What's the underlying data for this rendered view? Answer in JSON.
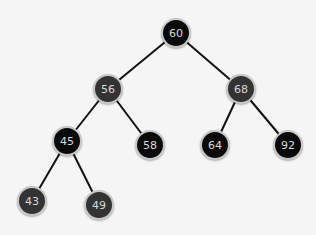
{
  "tree": {
    "nodes": [
      {
        "id": "n60",
        "value": "60",
        "x": 176,
        "y": 33,
        "color": "black"
      },
      {
        "id": "n56",
        "value": "56",
        "x": 108,
        "y": 89,
        "color": "gray"
      },
      {
        "id": "n68",
        "value": "68",
        "x": 241,
        "y": 89,
        "color": "gray"
      },
      {
        "id": "n45",
        "value": "45",
        "x": 67,
        "y": 141,
        "color": "black"
      },
      {
        "id": "n58",
        "value": "58",
        "x": 150,
        "y": 145,
        "color": "black"
      },
      {
        "id": "n64",
        "value": "64",
        "x": 215,
        "y": 145,
        "color": "black"
      },
      {
        "id": "n92",
        "value": "92",
        "x": 288,
        "y": 145,
        "color": "black"
      },
      {
        "id": "n43",
        "value": "43",
        "x": 32,
        "y": 201,
        "color": "gray"
      },
      {
        "id": "n49",
        "value": "49",
        "x": 99,
        "y": 205,
        "color": "gray"
      }
    ],
    "edges": [
      [
        "n60",
        "n56"
      ],
      [
        "n60",
        "n68"
      ],
      [
        "n56",
        "n45"
      ],
      [
        "n56",
        "n58"
      ],
      [
        "n68",
        "n64"
      ],
      [
        "n68",
        "n92"
      ],
      [
        "n45",
        "n43"
      ],
      [
        "n45",
        "n49"
      ]
    ]
  }
}
